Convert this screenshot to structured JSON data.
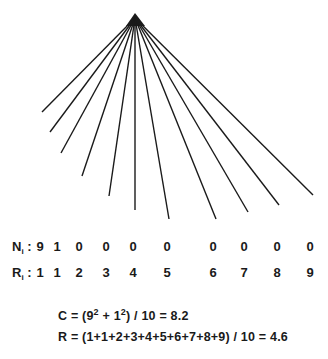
{
  "diagram": {
    "apex": {
      "x": 135,
      "y": 14
    },
    "line_color": "#1a1a1a",
    "line_endpoints": [
      {
        "x": 42,
        "y": 112
      },
      {
        "x": 50,
        "y": 132
      },
      {
        "x": 61,
        "y": 153
      },
      {
        "x": 82,
        "y": 176
      },
      {
        "x": 109,
        "y": 196
      },
      {
        "x": 135,
        "y": 210
      },
      {
        "x": 169,
        "y": 219
      },
      {
        "x": 216,
        "y": 219
      },
      {
        "x": 248,
        "y": 212
      },
      {
        "x": 279,
        "y": 205
      },
      {
        "x": 313,
        "y": 195
      }
    ]
  },
  "table": {
    "n_row": {
      "label": "N",
      "subscript": "i",
      "separator": ":",
      "values": [
        "9",
        "1",
        "0",
        "0",
        "0",
        "0",
        "0",
        "0",
        "0",
        "0"
      ]
    },
    "r_row": {
      "label": "R",
      "subscript": "i",
      "separator": ":",
      "values": [
        "1",
        "1",
        "2",
        "3",
        "4",
        "5",
        "6",
        "7",
        "8",
        "9"
      ]
    },
    "column_x": [
      40,
      57,
      79,
      106,
      133,
      167,
      213,
      244,
      277,
      310
    ]
  },
  "formulas": {
    "c": {
      "prefix": "C = (9",
      "exp1": "2",
      "mid": " + 1",
      "exp2": "2",
      "suffix": ") / 10 = 8.2"
    },
    "r": {
      "text": "R = (1+1+2+3+4+5+6+7+8+9) / 10 = 4.6"
    }
  }
}
